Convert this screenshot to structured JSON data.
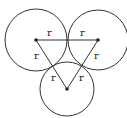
{
  "diagram": {
    "stroke_color": "#333333",
    "background": "#ffffff",
    "circles": [
      {
        "id": "left",
        "center_label": ""
      },
      {
        "id": "right",
        "center_label": ""
      },
      {
        "id": "bottom",
        "center_label": ""
      }
    ],
    "triangle_edges": [
      {
        "from": "left",
        "to": "right",
        "labels": [
          "r",
          "r"
        ]
      },
      {
        "from": "left",
        "to": "bottom",
        "labels": [
          "r",
          "r"
        ]
      },
      {
        "from": "right",
        "to": "bottom",
        "labels": [
          "r",
          "r"
        ]
      }
    ]
  }
}
